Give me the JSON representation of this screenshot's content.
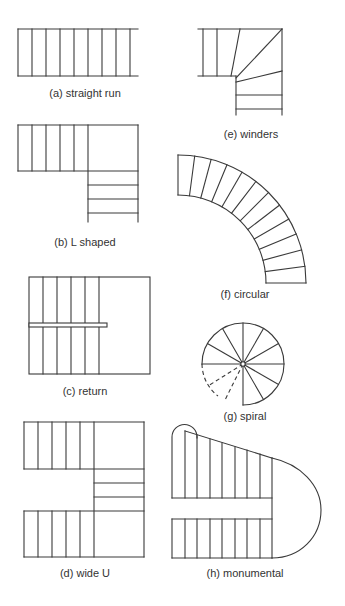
{
  "figure": {
    "panels": [
      {
        "id": "a",
        "label": "(a) straight run",
        "type": "straight run"
      },
      {
        "id": "b",
        "label": "(b) L shaped",
        "type": "L shaped"
      },
      {
        "id": "c",
        "label": "(c) return",
        "type": "return"
      },
      {
        "id": "d",
        "label": "(d) wide U",
        "type": "wide U"
      },
      {
        "id": "e",
        "label": "(e) winders",
        "type": "winders"
      },
      {
        "id": "f",
        "label": "(f) circular",
        "type": "circular"
      },
      {
        "id": "g",
        "label": "(g) spiral",
        "type": "spiral"
      },
      {
        "id": "h",
        "label": "(h) monumental",
        "type": "monumental"
      }
    ],
    "colors": {
      "line": "#3a3a3a",
      "text": "#333333",
      "background": "#ffffff"
    }
  }
}
